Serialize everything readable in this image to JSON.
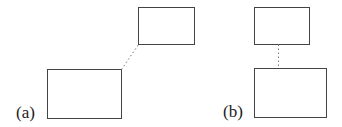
{
  "panels": [
    {
      "label": "(a)",
      "small_box": {
        "x": 138,
        "y": 7,
        "w": 56,
        "h": 37
      },
      "large_box": {
        "x": 47,
        "y": 69,
        "w": 74,
        "h": 49
      },
      "connector": {
        "style": "dotted",
        "from": "large_box top-right corner",
        "to": "small_box bottom-left corner"
      }
    },
    {
      "label": "(b)",
      "small_box": {
        "x": 254,
        "y": 7,
        "w": 55,
        "h": 37
      },
      "large_box": {
        "x": 254,
        "y": 68,
        "w": 72,
        "h": 49
      },
      "connector": {
        "style": "dotted",
        "orientation": "vertical"
      }
    }
  ],
  "colors": {
    "stroke": "#444444",
    "connector": "#777777",
    "background": "#ffffff"
  }
}
